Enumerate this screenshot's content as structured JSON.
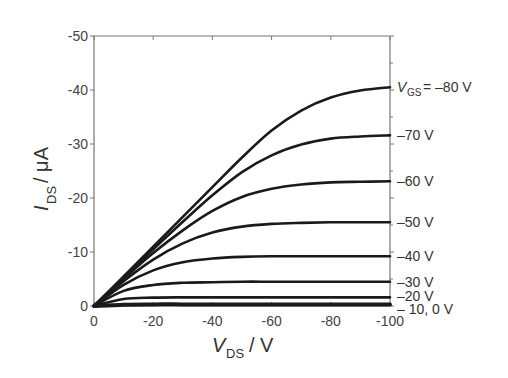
{
  "chart_data": {
    "type": "line",
    "title": "",
    "xlabel": "V_DS / V",
    "ylabel": "I_DS / μA",
    "xlabel_main": "V",
    "xlabel_sub": "DS",
    "xlabel_unit": " / V",
    "ylabel_main": "I",
    "ylabel_sub": "DS",
    "ylabel_unit": " / μA",
    "xlim": [
      0,
      -100
    ],
    "ylim": [
      0,
      -50
    ],
    "x_ticks": [
      "0",
      "-20",
      "-40",
      "-60",
      "-80",
      "-100"
    ],
    "y_ticks": [
      "0",
      "-10",
      "-20",
      "-30",
      "-40",
      "-50"
    ],
    "grid": false,
    "legend_position": "inline-right",
    "x": [
      0,
      -10,
      -20,
      -30,
      -40,
      -50,
      -60,
      -70,
      -80,
      -90,
      -100
    ],
    "series": [
      {
        "name": "V_GS = -80 V",
        "label": "V_GS = –80 V",
        "values": [
          0,
          -5.5,
          -11,
          -16.5,
          -22,
          -27.5,
          -32.5,
          -36.2,
          -38.6,
          -39.9,
          -40.5
        ]
      },
      {
        "name": "-70 V",
        "label": "–70 V",
        "values": [
          0,
          -5.3,
          -10.5,
          -15.6,
          -20.5,
          -24.8,
          -27.9,
          -29.9,
          -31,
          -31.4,
          -31.6
        ]
      },
      {
        "name": "-60 V",
        "label": "–60 V",
        "values": [
          0,
          -5,
          -9.8,
          -14,
          -17.6,
          -20.2,
          -21.7,
          -22.5,
          -22.9,
          -23,
          -23.1
        ]
      },
      {
        "name": "-50 V",
        "label": "–50 V",
        "values": [
          0,
          -4.6,
          -8.6,
          -11.6,
          -13.6,
          -14.7,
          -15.2,
          -15.4,
          -15.5,
          -15.5,
          -15.5
        ]
      },
      {
        "name": "-40 V",
        "label": "–40 V",
        "values": [
          0,
          -3.9,
          -6.6,
          -8.1,
          -8.8,
          -9.1,
          -9.2,
          -9.2,
          -9.2,
          -9.2,
          -9.2
        ]
      },
      {
        "name": "-30 V",
        "label": "–30 V",
        "values": [
          0,
          -2.8,
          -3.9,
          -4.3,
          -4.4,
          -4.5,
          -4.5,
          -4.5,
          -4.5,
          -4.5,
          -4.5
        ]
      },
      {
        "name": "-20 V",
        "label": "–20 V",
        "values": [
          0,
          -1.3,
          -1.55,
          -1.6,
          -1.6,
          -1.6,
          -1.6,
          -1.6,
          -1.6,
          -1.6,
          -1.6
        ]
      },
      {
        "name": "-10, 0 V",
        "label": "– 10, 0 V",
        "values": [
          0,
          -0.25,
          -0.3,
          -0.3,
          -0.3,
          -0.3,
          -0.3,
          -0.3,
          -0.3,
          -0.3,
          -0.3
        ]
      }
    ]
  }
}
